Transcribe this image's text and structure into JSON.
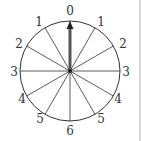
{
  "dial": {
    "labels": [
      "0",
      "1",
      "2",
      "3",
      "4",
      "5",
      "6",
      "5",
      "4",
      "3",
      "2",
      "1"
    ],
    "sectors": 12,
    "pointer": "0"
  },
  "colors": {
    "line": "#333333",
    "arrow": "#555555",
    "edge": "#aaaaaa"
  }
}
